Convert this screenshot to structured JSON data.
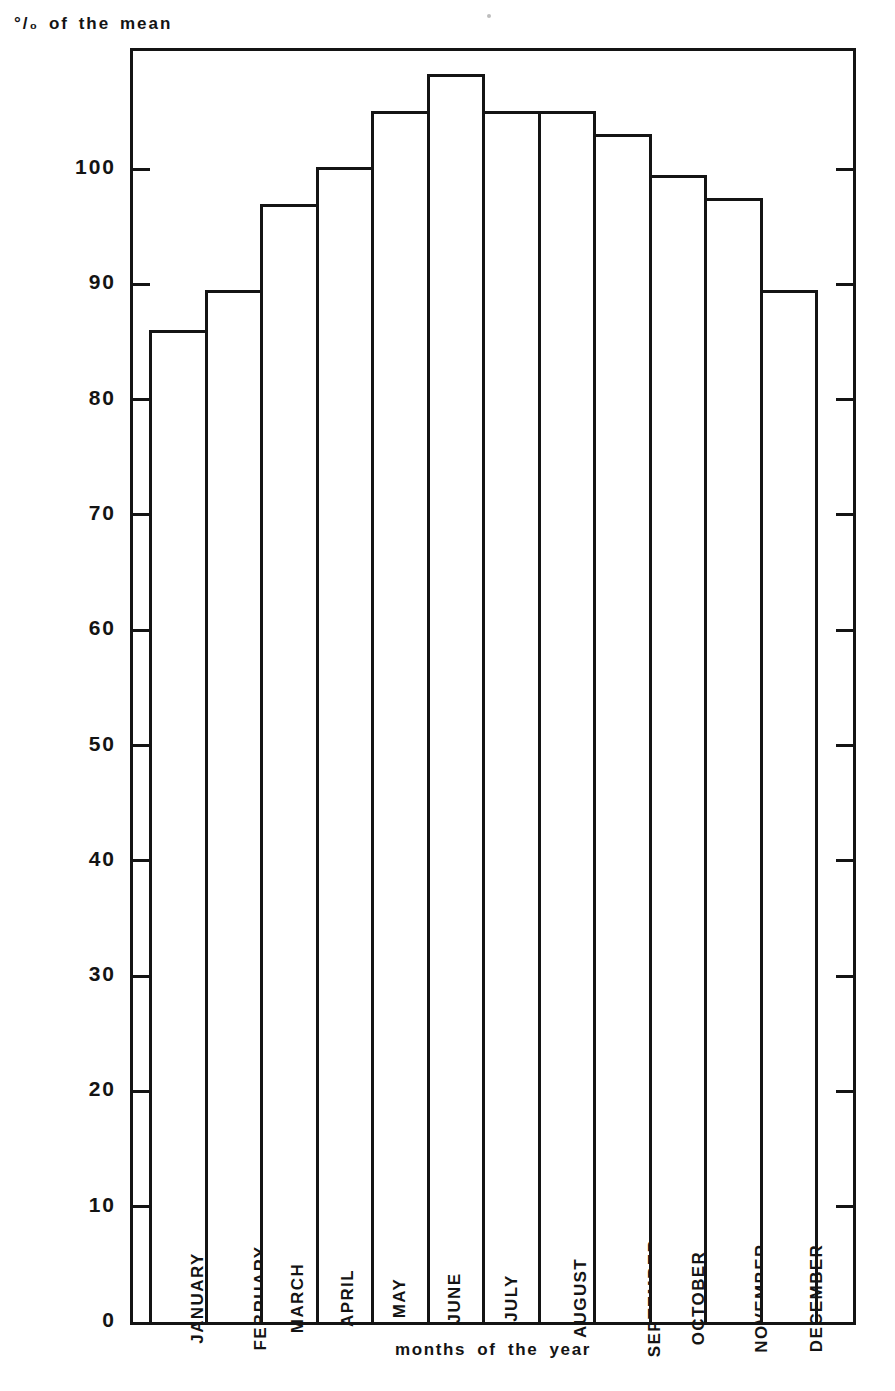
{
  "chart_data": {
    "type": "bar",
    "title": "",
    "subtitle": "",
    "ylabel": "°/₀ of the mean",
    "xlabel": "months  of  the  year",
    "categories": [
      "JANUARY",
      "FEBRUARY",
      "MARCH",
      "APRIL",
      "MAY",
      "JUNE",
      "JULY",
      "AUGUST",
      "SEPTEMBER",
      "OCTOBER",
      "NOVEMBER",
      "DECEMBER"
    ],
    "values": [
      86.0,
      89.5,
      97.0,
      100.2,
      105.0,
      108.2,
      105.0,
      105.0,
      103.0,
      99.5,
      97.5,
      89.5
    ],
    "ytick_labels": [
      "0",
      "10",
      "20",
      "30",
      "40",
      "50",
      "60",
      "70",
      "80",
      "90",
      "100"
    ],
    "ytick_values": [
      0,
      10,
      20,
      30,
      40,
      50,
      60,
      70,
      80,
      90,
      100
    ],
    "ylim": [
      0,
      110
    ],
    "xtick_labels": [],
    "grid": false,
    "legend": [],
    "legend_position": "none",
    "bar_fill_color": "#ffffff",
    "bar_edge_color": "#141414",
    "axis_color": "#141414",
    "background_color": "#ffffff",
    "series_name": "percent of the mean",
    "annotations": []
  },
  "axis_captions": {
    "y": "°/₀ of the mean",
    "x": "months  of  the  year"
  }
}
